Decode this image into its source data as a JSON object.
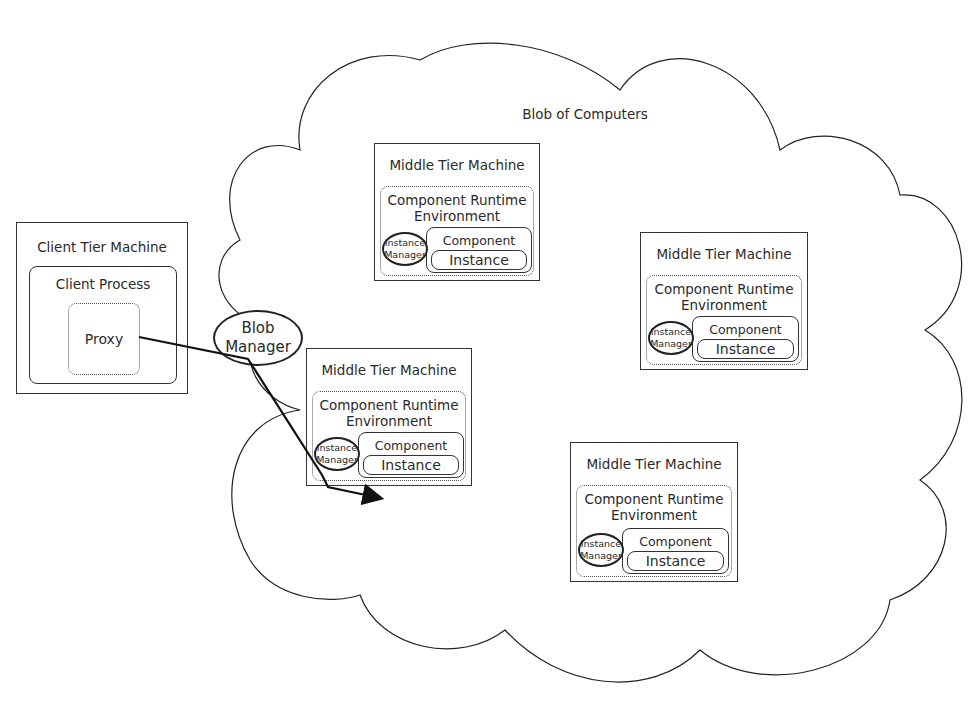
{
  "cloud": {
    "title": "Blob of Computers"
  },
  "client": {
    "machine_label": "Client Tier Machine",
    "process_label": "Client Process",
    "proxy_label": "Proxy"
  },
  "blob_manager": {
    "label_line1": "Blob",
    "label_line2": "Manager"
  },
  "middle_tier": [
    {
      "machine_label": "Middle Tier Machine",
      "env_line1": "Component Runtime",
      "env_line2": "Environment",
      "manager_line1": "Instance",
      "manager_line2": "Manager",
      "process_label": "Component Process",
      "instance_label": "Instance"
    },
    {
      "machine_label": "Middle Tier Machine",
      "env_line1": "Component Runtime",
      "env_line2": "Environment",
      "manager_line1": "Instance",
      "manager_line2": "Manager",
      "process_label": "Component Process",
      "instance_label": "Instance"
    },
    {
      "machine_label": "Middle Tier Machine",
      "env_line1": "Component Runtime",
      "env_line2": "Environment",
      "manager_line1": "Instance",
      "manager_line2": "Manager",
      "process_label": "Component Process",
      "instance_label": "Instance"
    },
    {
      "machine_label": "Middle Tier Machine",
      "env_line1": "Component Runtime",
      "env_line2": "Environment",
      "manager_line1": "Instance",
      "manager_line2": "Manager",
      "process_label": "Component Process",
      "instance_label": "Instance"
    }
  ],
  "connections": [
    {
      "from": "Proxy",
      "via": "Blob Manager",
      "via2": "Instance Manager",
      "to": "Instance"
    }
  ]
}
